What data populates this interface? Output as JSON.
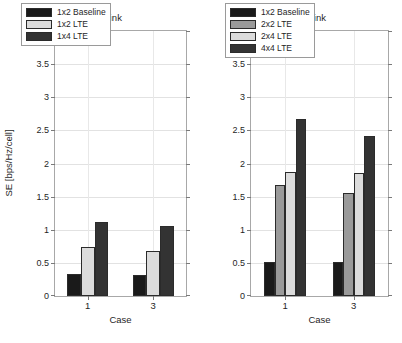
{
  "figure": {
    "caption_clipped": ""
  },
  "chart_data": [
    {
      "type": "bar",
      "title": "Uplink",
      "xlabel": "Case",
      "ylabel": "SE [bps/Hz/cell]",
      "categories": [
        "1",
        "3"
      ],
      "ylim": [
        0,
        4
      ],
      "yticks": [
        "0",
        "0.5",
        "1",
        "1.5",
        "2",
        "2.5",
        "3",
        "3.5",
        "4"
      ],
      "ytick_values": [
        0,
        0.5,
        1,
        1.5,
        2,
        2.5,
        3,
        3.5,
        4
      ],
      "grid": true,
      "legend_position": "upper center",
      "series": [
        {
          "name": "1x2 Baseline",
          "color": "#1a1a1a",
          "values": [
            0.33,
            0.32
          ]
        },
        {
          "name": "1x2 LTE",
          "color": "#dcdcdc",
          "values": [
            0.74,
            0.68
          ]
        },
        {
          "name": "1x4 LTE",
          "color": "#333333",
          "values": [
            1.11,
            1.05
          ]
        }
      ]
    },
    {
      "type": "bar",
      "title": "Downlink",
      "xlabel": "Case",
      "ylabel": "SE [bps/Hz/cell]",
      "categories": [
        "1",
        "3"
      ],
      "ylim": [
        0,
        4
      ],
      "yticks": [
        "0",
        "0.5",
        "1",
        "1.5",
        "2",
        "2.5",
        "3",
        "3.5",
        "4"
      ],
      "ytick_values": [
        0,
        0.5,
        1,
        1.5,
        2,
        2.5,
        3,
        3.5,
        4
      ],
      "grid": true,
      "legend_position": "upper center",
      "series": [
        {
          "name": "1x2 Baseline",
          "color": "#1a1a1a",
          "values": [
            0.52,
            0.51
          ]
        },
        {
          "name": "2x2 LTE",
          "color": "#9a9a9a",
          "values": [
            1.68,
            1.56
          ]
        },
        {
          "name": "2x4 LTE",
          "color": "#dcdcdc",
          "values": [
            1.87,
            1.85
          ]
        },
        {
          "name": "4x4 LTE",
          "color": "#333333",
          "values": [
            2.67,
            2.42
          ]
        }
      ]
    }
  ]
}
